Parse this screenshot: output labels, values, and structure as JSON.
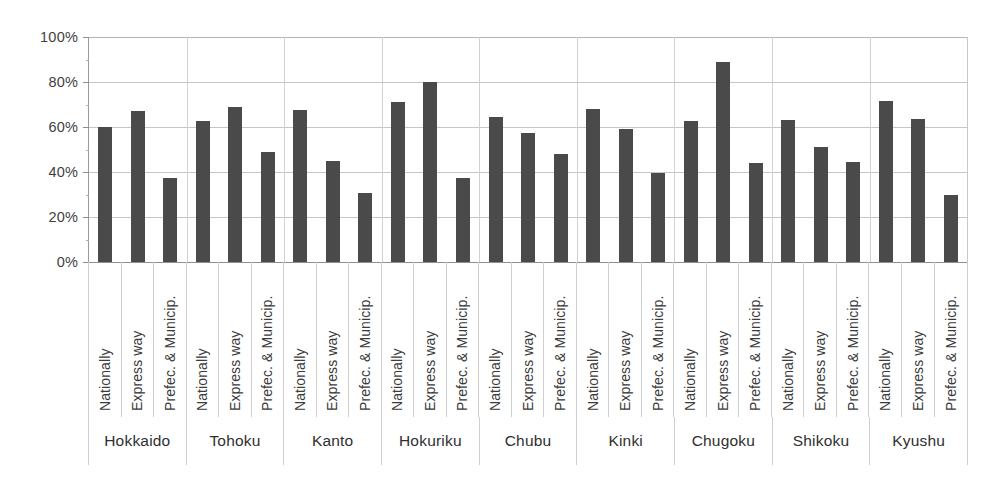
{
  "chart_data": {
    "type": "bar",
    "title": "",
    "subtitle": "",
    "xlabel": "",
    "ylabel": "",
    "ylim": [
      0,
      100
    ],
    "y_tick_labels": [
      "100%",
      "80%",
      "60%",
      "40%",
      "20%",
      "0%"
    ],
    "y_tick_values": [
      100,
      80,
      60,
      40,
      20,
      0
    ],
    "y_minor_step": 10,
    "grid": true,
    "legend": "none",
    "axis_unit": "%",
    "categories": [
      "Hokkaido",
      "Tohoku",
      "Kanto",
      "Hokuriku",
      "Chubu",
      "Kinki",
      "Chugoku",
      "Shikoku",
      "Kyushu"
    ],
    "subcategories": [
      "Nationally",
      "Express way",
      "Prefec. & Municip."
    ],
    "series": [
      {
        "name": "Nationally",
        "values": [
          60,
          62.5,
          67.5,
          71,
          64.5,
          68,
          62.5,
          63,
          71.5
        ]
      },
      {
        "name": "Express way",
        "values": [
          67,
          69,
          45,
          80,
          57.5,
          59,
          89,
          51,
          63.5
        ]
      },
      {
        "name": "Prefec. & Municip.",
        "values": [
          37.5,
          49,
          30.5,
          37.5,
          48,
          39.5,
          44,
          44.5,
          30
        ]
      }
    ],
    "groups": [
      {
        "region": "Hokkaido",
        "bars": [
          {
            "label": "Nationally",
            "value": 60
          },
          {
            "label": "Express way",
            "value": 67
          },
          {
            "label": "Prefec. & Municip.",
            "value": 37.5
          }
        ]
      },
      {
        "region": "Tohoku",
        "bars": [
          {
            "label": "Nationally",
            "value": 62.5
          },
          {
            "label": "Express way",
            "value": 69
          },
          {
            "label": "Prefec. & Municip.",
            "value": 49
          }
        ]
      },
      {
        "region": "Kanto",
        "bars": [
          {
            "label": "Nationally",
            "value": 67.5
          },
          {
            "label": "Express way",
            "value": 45
          },
          {
            "label": "Prefec. & Municip.",
            "value": 30.5
          }
        ]
      },
      {
        "region": "Hokuriku",
        "bars": [
          {
            "label": "Nationally",
            "value": 71
          },
          {
            "label": "Express way",
            "value": 80
          },
          {
            "label": "Prefec. & Municip.",
            "value": 37.5
          }
        ]
      },
      {
        "region": "Chubu",
        "bars": [
          {
            "label": "Nationally",
            "value": 64.5
          },
          {
            "label": "Express way",
            "value": 57.5
          },
          {
            "label": "Prefec. & Municip.",
            "value": 48
          }
        ]
      },
      {
        "region": "Kinki",
        "bars": [
          {
            "label": "Nationally",
            "value": 68
          },
          {
            "label": "Express way",
            "value": 59
          },
          {
            "label": "Prefec. & Municip.",
            "value": 39.5
          }
        ]
      },
      {
        "region": "Chugoku",
        "bars": [
          {
            "label": "Nationally",
            "value": 62.5
          },
          {
            "label": "Express way",
            "value": 89
          },
          {
            "label": "Prefec. & Municip.",
            "value": 44
          }
        ]
      },
      {
        "region": "Shikoku",
        "bars": [
          {
            "label": "Nationally",
            "value": 63
          },
          {
            "label": "Express way",
            "value": 51
          },
          {
            "label": "Prefec. & Municip.",
            "value": 44.5
          }
        ]
      },
      {
        "region": "Kyushu",
        "bars": [
          {
            "label": "Nationally",
            "value": 71.5
          },
          {
            "label": "Express way",
            "value": 63.5
          },
          {
            "label": "Prefec. & Municip.",
            "value": 30
          }
        ]
      }
    ],
    "colors": {
      "bar": "#4a4a4a",
      "grid": "#c6c6c6",
      "axis": "#8f8f8f",
      "text": "#3f3f3f",
      "background": "#ffffff"
    }
  }
}
